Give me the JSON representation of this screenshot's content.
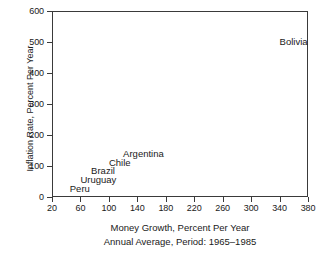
{
  "chart_data": {
    "type": "scatter",
    "title": "",
    "xlabel": "Money Growth, Percent Per Year",
    "sublabel": "Annual Average, Period: 1965–1985",
    "ylabel": "Inflation Rate, Percent Per Year",
    "xlim": [
      20,
      380
    ],
    "ylim": [
      0,
      600
    ],
    "xticks": [
      20,
      60,
      100,
      140,
      180,
      220,
      260,
      300,
      340,
      380
    ],
    "xtick_labels": [
      "20",
      "60",
      "100",
      "140",
      "180",
      "220",
      "260",
      "300",
      "340",
      "380"
    ],
    "yticks": [
      0,
      100,
      200,
      300,
      400,
      500,
      600
    ],
    "ytick_labels": [
      "0",
      "100",
      "200",
      "300",
      "400",
      "500",
      "600"
    ],
    "grid": false,
    "legend": false,
    "marker_style": "text-label-only",
    "points": [
      {
        "label": "Bolivia",
        "x": 340,
        "y": 500
      },
      {
        "label": "Argentina",
        "x": 120,
        "y": 140
      },
      {
        "label": "Chile",
        "x": 100,
        "y": 110
      },
      {
        "label": "Brazil",
        "x": 75,
        "y": 85
      },
      {
        "label": "Uruguay",
        "x": 60,
        "y": 55
      },
      {
        "label": "Peru",
        "x": 45,
        "y": 25
      }
    ]
  },
  "axis_color": "#3a3a3a",
  "text_color": "#1a1a1a",
  "background": "#ffffff"
}
